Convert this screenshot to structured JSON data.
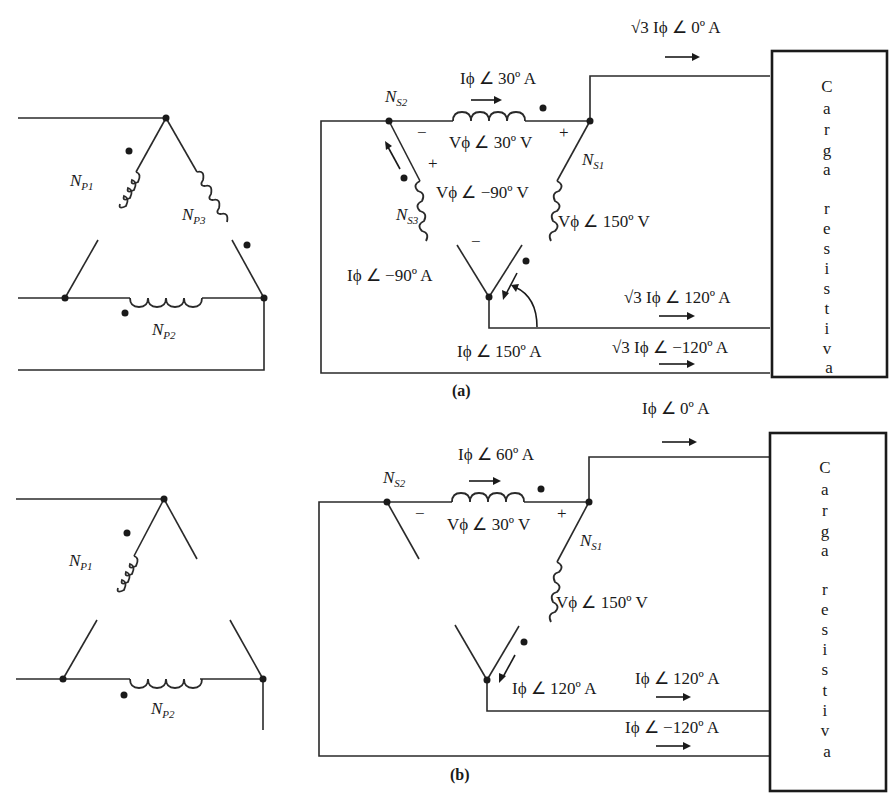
{
  "figure": {
    "panel_a": {
      "caption": "(a)",
      "primary": {
        "windings": [
          "N_P1",
          "N_P2",
          "N_P3"
        ],
        "labels": {
          "p1": "N",
          "p1_sub": "P1",
          "p2": "N",
          "p2_sub": "P2",
          "p3": "N",
          "p3_sub": "P3"
        }
      },
      "secondary": {
        "ns1": "N",
        "ns1_sub": "S1",
        "ns2": "N",
        "ns2_sub": "S2",
        "ns3": "N",
        "ns3_sub": "S3",
        "i_ns2": "Iϕ ∠ 30º A",
        "v_ns2": "Vϕ ∠ 30º V",
        "v_ns3": "Vϕ ∠ −90º V",
        "v_ns1": "Vϕ ∠ 150º V",
        "i_ns3": "Iϕ ∠ −90º A",
        "i_ns1": "Iϕ ∠ 150º A",
        "plus": "+",
        "minus": "−"
      },
      "line_currents": {
        "top": "√3 Iϕ ∠ 0º A",
        "middle": "√3 Iϕ ∠ 120º A",
        "bottom": "√3 Iϕ ∠ −120º A"
      },
      "load": {
        "line1": "Carga",
        "line2": "resistiva",
        "letters": [
          "C",
          "a",
          "r",
          "g",
          "a",
          "",
          "r",
          "e",
          "s",
          "i",
          "s",
          "t",
          "i",
          "v",
          "a"
        ]
      }
    },
    "panel_b": {
      "caption": "(b)",
      "primary": {
        "labels": {
          "p1": "N",
          "p1_sub": "P1",
          "p2": "N",
          "p2_sub": "P2"
        }
      },
      "secondary": {
        "ns1": "N",
        "ns1_sub": "S1",
        "ns2": "N",
        "ns2_sub": "S2",
        "i_ns2": "Iϕ ∠ 60º A",
        "v_ns2": "Vϕ ∠ 30º V",
        "v_ns1": "Vϕ ∠ 150º V",
        "i_ns1": "Iϕ ∠ 120º A",
        "plus": "+",
        "minus": "−"
      },
      "line_currents": {
        "top": "Iϕ ∠ 0º A",
        "middle": "Iϕ ∠ 120º A",
        "bottom": "Iϕ ∠ −120º A"
      },
      "load": {
        "line1": "Carga",
        "line2": "resistiva",
        "letters": [
          "C",
          "a",
          "r",
          "g",
          "a",
          "",
          "r",
          "e",
          "s",
          "i",
          "s",
          "t",
          "i",
          "v",
          "a"
        ]
      }
    }
  }
}
